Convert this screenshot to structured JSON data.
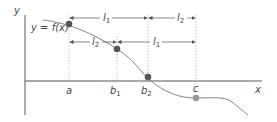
{
  "diagram": {
    "axes": {
      "x_label": "x",
      "y_label": "y"
    },
    "curve_label": "y = f(x)",
    "points": [
      {
        "name": "a",
        "label": "a",
        "sub": ""
      },
      {
        "name": "b1",
        "label": "b",
        "sub": "1"
      },
      {
        "name": "b2",
        "label": "b",
        "sub": "2"
      },
      {
        "name": "c",
        "label": "c",
        "sub": ""
      }
    ],
    "intervals": [
      {
        "label": "l",
        "sub": "1",
        "from": "a",
        "to": "b2"
      },
      {
        "label": "l",
        "sub": "2",
        "from": "b2",
        "to": "c"
      },
      {
        "label": "l",
        "sub": "2",
        "from": "a",
        "to": "b1"
      },
      {
        "label": "l",
        "sub": "1",
        "from": "b1",
        "to": "c"
      }
    ],
    "colors": {
      "axis": "#555555",
      "curve": "#777777",
      "point_dark": "#555555",
      "point_light": "#999999",
      "guide": "#aaaaaa"
    }
  }
}
